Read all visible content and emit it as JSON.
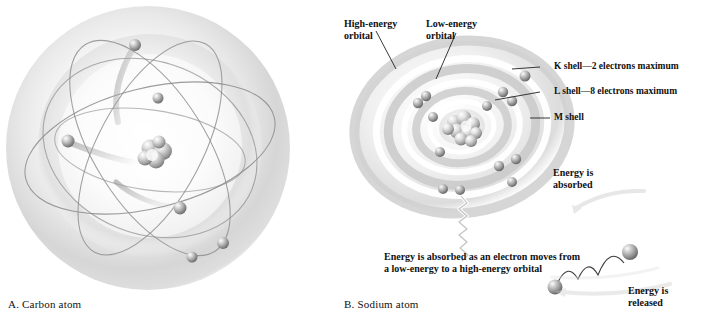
{
  "figure": {
    "panel_a": {
      "caption": "A. Carbon atom",
      "nucleus": "carbon-nucleus",
      "electron_count": 6,
      "orbital_count": 4
    },
    "panel_b": {
      "caption": "B. Sodium atom",
      "nucleus": "sodium-nucleus",
      "labels": {
        "high_energy_orbital": "High-energy\norbital",
        "low_energy_orbital": "Low-energy\norbital",
        "k_shell": "K shell—2 electrons maximum",
        "l_shell": "L shell—8 electrons maximum",
        "m_shell": "M shell",
        "energy_absorbed": "Energy is\nabsorbed",
        "energy_released": "Energy is\nreleased",
        "absorption_note": "Energy is absorbed as an electron moves from a low-energy to a high-energy orbital"
      },
      "shells": [
        {
          "name": "K",
          "electrons": 2,
          "max": 2
        },
        {
          "name": "L",
          "electrons": 8,
          "max": 8
        },
        {
          "name": "M",
          "electrons": 1,
          "max": 8
        }
      ]
    },
    "colors": {
      "text": "#111111",
      "orbit_line": "#6e6e6e",
      "sphere_light": "#f2f2f2",
      "sphere_mid": "#b9b9b9",
      "sphere_dark": "#6b6b6b",
      "cloud_outer": "#d8d8d8",
      "cloud_inner": "#ffffff",
      "shell_band": "#c4c4c4",
      "leader_line": "#2b2b2b"
    }
  }
}
